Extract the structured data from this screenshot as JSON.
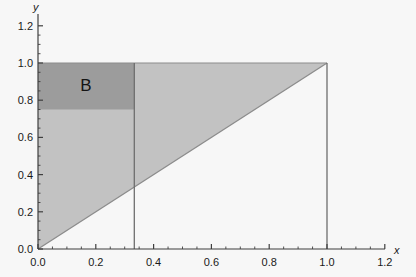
{
  "figure": {
    "background_color": "#f7f7f7",
    "axis_color": "#3f3f3f",
    "region_label": "B"
  },
  "chart_data": {
    "type": "area",
    "title": "",
    "xlabel": "x",
    "ylabel": "y",
    "xlim": [
      0.0,
      1.2
    ],
    "ylim": [
      0.0,
      1.2
    ],
    "grid": false,
    "legend": "none",
    "xticks": [
      0.0,
      0.2,
      0.4,
      0.6,
      0.8,
      1.0,
      1.2
    ],
    "xtick_labels": [
      "0.0",
      "0.2",
      "0.4",
      "0.6",
      "0.8",
      "1.0",
      "1.2"
    ],
    "yticks": [
      0.0,
      0.2,
      0.4,
      0.6,
      0.8,
      1.0,
      1.2
    ],
    "ytick_labels": [
      "0.0",
      "0.2",
      "0.4",
      "0.6",
      "0.8",
      "1.0",
      "1.2"
    ],
    "minor_tick_step": 0.05,
    "shapes": [
      {
        "name": "unit-triangle",
        "kind": "polygon",
        "description": "region above the line y = x inside the unit square",
        "points": [
          [
            0.0,
            0.0
          ],
          [
            1.0,
            1.0
          ],
          [
            0.0,
            1.0
          ]
        ],
        "fill": "#c2c2c2",
        "edge": "#8c8c8c"
      },
      {
        "name": "region-b-rectangle",
        "kind": "rectangle",
        "description": "highlighted sub-region B",
        "x_range": [
          0.0,
          0.3333
        ],
        "y_range": [
          0.75,
          1.0
        ],
        "fill": "#9c9c9c",
        "edge": "none",
        "label": "B",
        "label_position": [
          0.165,
          0.885
        ]
      }
    ],
    "lines": [
      {
        "name": "diagonal-y-equals-x",
        "points": [
          [
            0.0,
            0.0
          ],
          [
            1.0,
            1.0
          ]
        ],
        "color": "#8c8c8c"
      },
      {
        "name": "vertical-line-x-one-third",
        "points": [
          [
            0.3333,
            0.0
          ],
          [
            0.3333,
            1.0
          ]
        ],
        "color": "#6e6e6e"
      },
      {
        "name": "vertical-line-x-one",
        "points": [
          [
            1.0,
            0.0
          ],
          [
            1.0,
            1.0
          ]
        ],
        "color": "#6e6e6e"
      },
      {
        "name": "horizontal-line-y-one",
        "points": [
          [
            0.0,
            1.0
          ],
          [
            1.0,
            1.0
          ]
        ],
        "color": "#8c8c8c"
      }
    ]
  }
}
